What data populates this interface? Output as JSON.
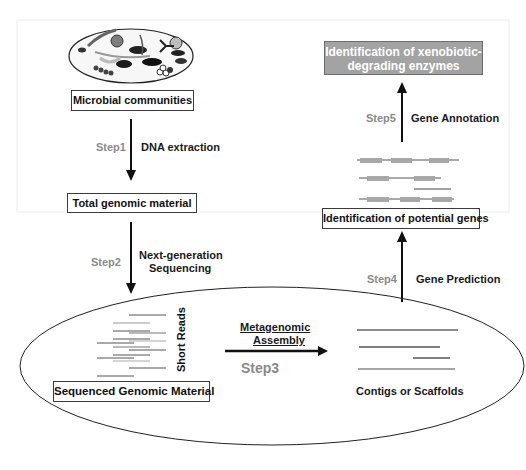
{
  "diagram": {
    "nodes": {
      "microbial_communities": "Microbial communities",
      "total_genomic_material": "Total genomic material",
      "sequenced_genomic_material": "Sequenced Genomic Material",
      "contigs_or_scaffolds": "Contigs or Scaffolds",
      "identification_potential_genes": "Identification of potential genes",
      "identification_enzymes_line1": "Identification of xenobiotic-",
      "identification_enzymes_line2": "degrading enzymes"
    },
    "steps": [
      {
        "label": "Step1",
        "action": "DNA extraction"
      },
      {
        "label": "Step2",
        "action_line1": "Next-generation",
        "action_line2": "Sequencing"
      },
      {
        "label": "Step3",
        "action_line1": "Metagenomic",
        "action_line2": "Assembly"
      },
      {
        "label": "Step4",
        "action": "Gene Prediction"
      },
      {
        "label": "Step5",
        "action": "Gene Annotation"
      }
    ],
    "short_reads_label": "Short Reads",
    "colors": {
      "step_label": "#8a8a8a",
      "text": "#111111",
      "enzyme_box_fill": "#a3a3a3",
      "gene_block": "#a8a8a8",
      "line": "#6a6a6a"
    }
  }
}
